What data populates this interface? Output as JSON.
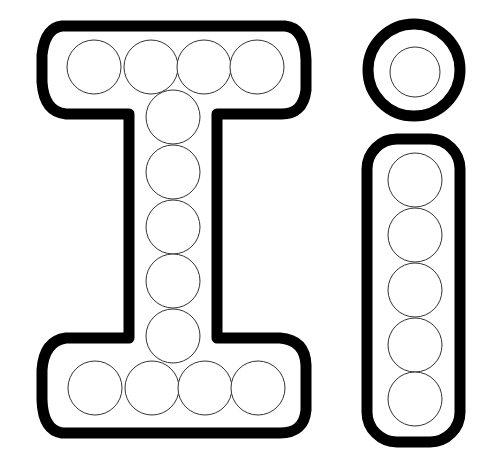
{
  "worksheet": {
    "title": "Letter I i dot marker",
    "uppercase_letter": "I",
    "lowercase_letter": "i",
    "outline_color": "#000000",
    "dot_stroke_color": "#333333",
    "dot_radius": 27,
    "uppercase_dots": [
      [
        94,
        67
      ],
      [
        151,
        67
      ],
      [
        204,
        67
      ],
      [
        257,
        67
      ],
      [
        173,
        117
      ],
      [
        173,
        172
      ],
      [
        173,
        227
      ],
      [
        173,
        281
      ],
      [
        173,
        336
      ],
      [
        95,
        388
      ],
      [
        152,
        388
      ],
      [
        205,
        388
      ],
      [
        258,
        388
      ]
    ],
    "dot_i_dot": [
      415,
      72
    ],
    "lowercase_dots": [
      [
        415,
        180
      ],
      [
        415,
        235
      ],
      [
        415,
        290
      ],
      [
        415,
        345
      ],
      [
        415,
        399
      ]
    ]
  }
}
